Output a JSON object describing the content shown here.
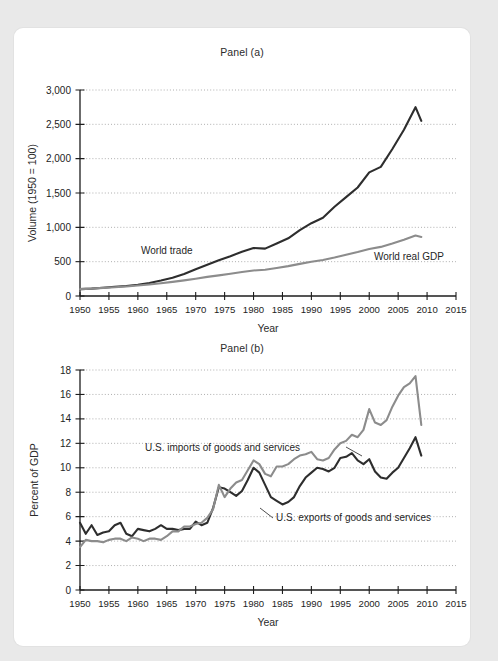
{
  "figure": {
    "background_color": "#e9e9e9",
    "card_color": "#ffffff",
    "series_dark_color": "#2e2e2e",
    "series_gray_color": "#8c8c8c"
  },
  "panel_a": {
    "title": "Panel (a)",
    "xlabel": "Year",
    "ylabel": "Volume (1950 = 100)",
    "label_world_trade": "World trade",
    "label_world_gdp": "World real GDP",
    "ytick_labels": [
      "0",
      "500",
      "1,000",
      "1,500",
      "2,000",
      "2,500",
      "3,000"
    ],
    "xtick_labels": [
      "1950",
      "1955",
      "1960",
      "1965",
      "1970",
      "1975",
      "1980",
      "1985",
      "1990",
      "1995",
      "2000",
      "2005",
      "2010",
      "2015"
    ]
  },
  "panel_b": {
    "title": "Panel (b)",
    "xlabel": "Year",
    "ylabel": "Percent of GDP",
    "label_imports": "U.S. imports of goods and services",
    "label_exports": "U.S. exports of goods and services",
    "ytick_labels": [
      "0",
      "2",
      "4",
      "6",
      "8",
      "10",
      "12",
      "14",
      "16",
      "18"
    ],
    "xtick_labels": [
      "1950",
      "1955",
      "1960",
      "1965",
      "1970",
      "1975",
      "1980",
      "1985",
      "1990",
      "1995",
      "2000",
      "2005",
      "2010",
      "2015"
    ]
  },
  "chart_data": [
    {
      "type": "line",
      "title": "Panel (a)",
      "xlabel": "Year",
      "ylabel": "Volume (1950 = 100)",
      "xlim": [
        1950,
        2015
      ],
      "ylim": [
        0,
        3000
      ],
      "ytick_step": 500,
      "xtick_step": 5,
      "grid": true,
      "legend": "inline-labels",
      "series": [
        {
          "name": "World trade",
          "color": "#2e2e2e",
          "x": [
            1950,
            1952,
            1954,
            1956,
            1958,
            1960,
            1962,
            1964,
            1966,
            1968,
            1970,
            1972,
            1974,
            1976,
            1978,
            1980,
            1982,
            1984,
            1986,
            1988,
            1990,
            1992,
            1994,
            1996,
            1998,
            2000,
            2002,
            2004,
            2006,
            2008,
            2009
          ],
          "y": [
            100,
            108,
            120,
            135,
            145,
            165,
            190,
            225,
            265,
            320,
            390,
            455,
            520,
            580,
            645,
            700,
            690,
            765,
            840,
            960,
            1060,
            1140,
            1300,
            1440,
            1580,
            1800,
            1880,
            2140,
            2420,
            2750,
            2550
          ]
        },
        {
          "name": "World real GDP",
          "color": "#8c8c8c",
          "x": [
            1950,
            1952,
            1954,
            1956,
            1958,
            1960,
            1962,
            1964,
            1966,
            1968,
            1970,
            1972,
            1974,
            1976,
            1978,
            1980,
            1982,
            1984,
            1986,
            1988,
            1990,
            1992,
            1994,
            1996,
            1998,
            2000,
            2002,
            2004,
            2006,
            2008,
            2009
          ],
          "y": [
            100,
            108,
            118,
            128,
            138,
            152,
            168,
            186,
            206,
            228,
            252,
            278,
            300,
            325,
            350,
            372,
            382,
            408,
            435,
            468,
            500,
            525,
            560,
            600,
            640,
            685,
            715,
            765,
            820,
            880,
            860
          ]
        }
      ]
    },
    {
      "type": "line",
      "title": "Panel (b)",
      "xlabel": "Year",
      "ylabel": "Percent of GDP",
      "xlim": [
        1950,
        2015
      ],
      "ylim": [
        0,
        18
      ],
      "ytick_step": 2,
      "xtick_step": 5,
      "grid": true,
      "legend": "inline-labels",
      "series": [
        {
          "name": "U.S. exports of goods and services",
          "color": "#2e2e2e",
          "x": [
            1950,
            1951,
            1952,
            1953,
            1954,
            1955,
            1956,
            1957,
            1958,
            1959,
            1960,
            1961,
            1962,
            1963,
            1964,
            1965,
            1966,
            1967,
            1968,
            1969,
            1970,
            1971,
            1972,
            1973,
            1974,
            1975,
            1976,
            1977,
            1978,
            1979,
            1980,
            1981,
            1982,
            1983,
            1984,
            1985,
            1986,
            1987,
            1988,
            1989,
            1990,
            1991,
            1992,
            1993,
            1994,
            1995,
            1996,
            1997,
            1998,
            1999,
            2000,
            2001,
            2002,
            2003,
            2004,
            2005,
            2006,
            2007,
            2008,
            2009
          ],
          "y": [
            5.5,
            4.6,
            5.3,
            4.5,
            4.7,
            4.8,
            5.3,
            5.5,
            4.6,
            4.4,
            5.0,
            4.9,
            4.8,
            5.0,
            5.3,
            5.0,
            5.0,
            4.9,
            5.0,
            5.0,
            5.6,
            5.3,
            5.5,
            6.7,
            8.4,
            8.3,
            8.0,
            7.7,
            8.1,
            9.0,
            10.0,
            9.6,
            8.6,
            7.6,
            7.3,
            7.0,
            7.2,
            7.6,
            8.5,
            9.2,
            9.6,
            10.0,
            9.9,
            9.7,
            10.0,
            10.8,
            10.9,
            11.2,
            10.6,
            10.3,
            10.7,
            9.7,
            9.2,
            9.1,
            9.6,
            10.0,
            10.8,
            11.6,
            12.5,
            11.0
          ]
        },
        {
          "name": "U.S. imports of goods and services",
          "color": "#8c8c8c",
          "x": [
            1950,
            1951,
            1952,
            1953,
            1954,
            1955,
            1956,
            1957,
            1958,
            1959,
            1960,
            1961,
            1962,
            1963,
            1964,
            1965,
            1966,
            1967,
            1968,
            1969,
            1970,
            1971,
            1972,
            1973,
            1974,
            1975,
            1976,
            1977,
            1978,
            1979,
            1980,
            1981,
            1982,
            1983,
            1984,
            1985,
            1986,
            1987,
            1988,
            1989,
            1990,
            1991,
            1992,
            1993,
            1994,
            1995,
            1996,
            1997,
            1998,
            1999,
            2000,
            2001,
            2002,
            2003,
            2004,
            2005,
            2006,
            2007,
            2008,
            2009
          ],
          "y": [
            3.5,
            4.1,
            4.0,
            4.0,
            3.9,
            4.1,
            4.2,
            4.2,
            4.0,
            4.3,
            4.2,
            4.0,
            4.2,
            4.2,
            4.1,
            4.4,
            4.8,
            4.8,
            5.2,
            5.2,
            5.4,
            5.5,
            5.9,
            6.6,
            8.6,
            7.6,
            8.3,
            8.8,
            9.0,
            9.8,
            10.6,
            10.3,
            9.5,
            9.3,
            10.1,
            10.1,
            10.3,
            10.7,
            11.0,
            11.1,
            11.3,
            10.7,
            10.6,
            10.8,
            11.5,
            12.0,
            12.2,
            12.7,
            12.5,
            13.1,
            14.8,
            13.7,
            13.5,
            13.9,
            15.0,
            15.9,
            16.6,
            16.9,
            17.5,
            13.5
          ]
        }
      ]
    }
  ]
}
